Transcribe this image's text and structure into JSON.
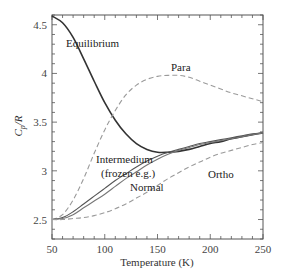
{
  "chart_data": {
    "type": "line",
    "title": "",
    "xlabel": "Temperature (K)",
    "ylabel": "Cp/R",
    "xlim": [
      50,
      250
    ],
    "ylim": [
      2.3,
      4.6
    ],
    "x_ticks": [
      50,
      100,
      150,
      200,
      250
    ],
    "y_ticks": [
      2.5,
      3,
      3.5,
      4,
      4.5
    ],
    "x_tick_labels": [
      "50",
      "100",
      "150",
      "200",
      "250"
    ],
    "y_tick_labels": [
      "2.5",
      "3",
      "3.5",
      "4",
      "4.5"
    ],
    "grid": false,
    "legend": "none (inline labels)",
    "x": [
      50,
      60,
      70,
      80,
      90,
      100,
      110,
      120,
      130,
      140,
      150,
      160,
      170,
      180,
      190,
      200,
      210,
      220,
      230,
      240,
      250
    ],
    "series": [
      {
        "name": "Equilibrium",
        "style": "solid",
        "color": "#333333",
        "values": [
          4.59,
          4.52,
          4.37,
          4.15,
          3.92,
          3.7,
          3.52,
          3.38,
          3.28,
          3.22,
          3.19,
          3.19,
          3.2,
          3.22,
          3.25,
          3.28,
          3.3,
          3.33,
          3.35,
          3.37,
          3.39
        ]
      },
      {
        "name": "Para",
        "style": "dashed",
        "color": "#9a9a9a",
        "values": [
          2.5,
          2.55,
          2.7,
          2.92,
          3.18,
          3.42,
          3.62,
          3.78,
          3.88,
          3.94,
          3.97,
          3.98,
          3.98,
          3.96,
          3.92,
          3.88,
          3.84,
          3.8,
          3.77,
          3.74,
          3.71
        ]
      },
      {
        "name": "Intermedium (frozen e.g.)",
        "style": "solid",
        "color": "#555555",
        "values": [
          2.5,
          2.52,
          2.58,
          2.66,
          2.74,
          2.82,
          2.9,
          2.97,
          3.04,
          3.1,
          3.15,
          3.19,
          3.22,
          3.25,
          3.28,
          3.3,
          3.32,
          3.34,
          3.36,
          3.38,
          3.39
        ]
      },
      {
        "name": "Normal",
        "style": "solid",
        "color": "#777777",
        "values": [
          2.5,
          2.51,
          2.55,
          2.62,
          2.69,
          2.76,
          2.84,
          2.92,
          2.99,
          3.06,
          3.12,
          3.17,
          3.21,
          3.24,
          3.27,
          3.29,
          3.31,
          3.33,
          3.35,
          3.37,
          3.39
        ]
      },
      {
        "name": "Ortho",
        "style": "dashed",
        "color": "#9a9a9a",
        "values": [
          2.5,
          2.5,
          2.51,
          2.52,
          2.54,
          2.57,
          2.61,
          2.66,
          2.72,
          2.78,
          2.85,
          2.92,
          2.98,
          3.04,
          3.09,
          3.14,
          3.18,
          3.21,
          3.24,
          3.27,
          3.29
        ]
      }
    ],
    "annotations": [
      {
        "text": "Equilibrium",
        "x": 62,
        "y": 4.25
      },
      {
        "text": "Para",
        "x": 160,
        "y": 4.12
      },
      {
        "text": "Intermedium",
        "x": 95,
        "y": 3.06
      },
      {
        "text": "(frozen e.g.)",
        "x": 99,
        "y": 2.93
      },
      {
        "text": "Normal",
        "x": 125,
        "y": 2.8
      },
      {
        "text": "Ortho",
        "x": 198,
        "y": 2.96
      }
    ]
  },
  "labels": {
    "xlabel": "Temperature (K)",
    "ylabel_main": "C",
    "ylabel_sub": "p",
    "ylabel_rest": "/R",
    "equilibrium": "Equilibrium",
    "para": "Para",
    "intermedium_1": "Intermedium",
    "intermedium_2": "(frozen e.g.)",
    "normal": "Normal",
    "ortho": "Ortho"
  }
}
